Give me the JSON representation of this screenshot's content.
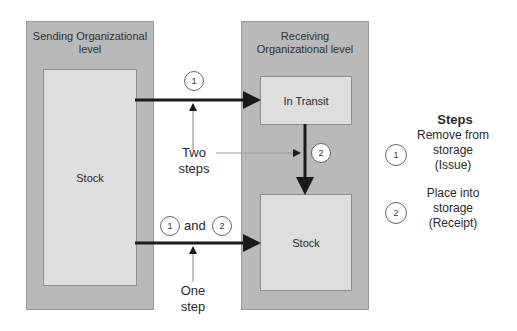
{
  "diagram": {
    "sending_level": {
      "title": "Sending Organizational level",
      "stock_label": "Stock"
    },
    "receiving_level": {
      "title": "Receiving Organizational level",
      "in_transit_label": "In Transit",
      "stock_label": "Stock"
    },
    "two_step": {
      "step1_marker": "1",
      "step2_marker": "2",
      "annotation": "Two steps"
    },
    "one_step": {
      "marker1": "1",
      "connector": "and",
      "marker2": "2",
      "annotation": "One step"
    },
    "legend": {
      "title": "Steps",
      "items": [
        {
          "marker": "1",
          "label": "Remove from storage (Issue)"
        },
        {
          "marker": "2",
          "label": "Place into storage (Receipt)"
        }
      ]
    },
    "colors": {
      "outer_box": "#b9b9b9",
      "inner_box": "#dedede",
      "arrow": "#1a1a1a",
      "thin_line": "#888888"
    }
  }
}
